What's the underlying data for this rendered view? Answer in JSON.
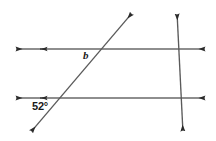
{
  "figure": {
    "width": 216,
    "height": 141,
    "background_color": "#ffffff",
    "stroke_color": "#595959",
    "arrow_color": "#2b2b2b",
    "labels": {
      "angle_b": "b",
      "angle_52": "52°"
    }
  },
  "chart_data": {
    "type": "diagram",
    "units": "pixels",
    "coordinate_system": "screen (x right, y down)",
    "xlim": [
      0,
      216
    ],
    "ylim": [
      0,
      141
    ],
    "grid": false,
    "legend": null,
    "lines": [
      {
        "name": "top-parallel-line",
        "kind": "horizontal",
        "x1": 14,
        "y1": 49,
        "x2": 207,
        "y2": 49,
        "arrow_start": true,
        "arrow_end": true,
        "tick_marks": [
          {
            "name": "parallel-mark",
            "x": 43,
            "y": 49,
            "direction": "right"
          }
        ]
      },
      {
        "name": "bottom-parallel-line",
        "kind": "horizontal",
        "x1": 14,
        "y1": 98,
        "x2": 207,
        "y2": 98,
        "arrow_start": true,
        "arrow_end": true,
        "tick_marks": [
          {
            "name": "parallel-mark",
            "x": 43,
            "y": 98,
            "direction": "right"
          }
        ]
      },
      {
        "name": "diagonal-transversal",
        "kind": "transversal",
        "x1": 30,
        "y1": 133,
        "x2": 133,
        "y2": 12,
        "arrow_start": true,
        "arrow_end": true
      },
      {
        "name": "vertical-transversal",
        "kind": "transversal",
        "x1": 177,
        "y1": 12,
        "x2": 183,
        "y2": 133,
        "arrow_start": true,
        "arrow_end": true
      }
    ],
    "intersections": [
      {
        "name": "diagonal-top",
        "x": 103,
        "y": 49
      },
      {
        "name": "diagonal-bottom",
        "x": 61,
        "y": 98
      },
      {
        "name": "vertical-top",
        "x": 179,
        "y": 49
      },
      {
        "name": "vertical-bottom",
        "x": 181,
        "y": 98
      }
    ],
    "annotations": [
      {
        "name": "angle-label-b",
        "text": "b",
        "x": 86,
        "y": 55,
        "italic": true,
        "refers_to": "angle below top line, left of diagonal transversal"
      },
      {
        "name": "angle-label-52",
        "text": "52°",
        "x": 40,
        "y": 106,
        "italic": false,
        "refers_to": "angle below bottom line, left of diagonal transversal"
      }
    ]
  }
}
